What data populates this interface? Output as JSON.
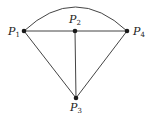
{
  "diagram": {
    "type": "geometry-sector",
    "points": [
      {
        "id": "P1",
        "label": "P",
        "sub": "1",
        "x": 24,
        "y": 31
      },
      {
        "id": "P2",
        "label": "P",
        "sub": "2",
        "x": 75,
        "y": 31
      },
      {
        "id": "P3",
        "label": "P",
        "sub": "3",
        "x": 76,
        "y": 98
      },
      {
        "id": "P4",
        "label": "P",
        "sub": "4",
        "x": 127,
        "y": 31
      }
    ],
    "segments": [
      [
        "P1",
        "P4"
      ],
      [
        "P1",
        "P3"
      ],
      [
        "P2",
        "P3"
      ],
      [
        "P4",
        "P3"
      ]
    ],
    "arcs": [
      {
        "from": "P1",
        "to": "P4",
        "apex_y": 7
      }
    ],
    "labels": {
      "p1": {
        "main": "P",
        "sub": "1"
      },
      "p2": {
        "main": "P",
        "sub": "2"
      },
      "p3": {
        "main": "P",
        "sub": "3"
      },
      "p4": {
        "main": "P",
        "sub": "4"
      }
    }
  }
}
